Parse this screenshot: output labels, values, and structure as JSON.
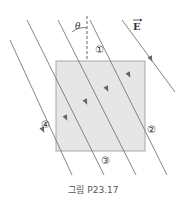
{
  "figure": {
    "caption": "그림 P23.17",
    "field_label": "E",
    "angle_label": "θ",
    "region_labels": [
      "①",
      "②",
      "③",
      "④"
    ],
    "colors": {
      "box_fill": "#e6e6e6",
      "box_stroke": "#a8a8a8",
      "field_line": "#777777",
      "text": "#333333"
    }
  },
  "diagram": {
    "box": {
      "x": 56,
      "y": 61,
      "width": 89,
      "height": 90
    },
    "field_lines": [
      {
        "x1": 10,
        "y1": 40,
        "x2": 72,
        "y2": 175
      },
      {
        "x1": 27,
        "y1": 20,
        "x2": 104,
        "y2": 175
      },
      {
        "x1": 58,
        "y1": 20,
        "x2": 136,
        "y2": 175
      },
      {
        "x1": 90,
        "y1": 20,
        "x2": 167,
        "y2": 175
      },
      {
        "x1": 122,
        "y1": 20,
        "x2": 175,
        "y2": 92
      }
    ],
    "direction": "up-left along field lines"
  }
}
